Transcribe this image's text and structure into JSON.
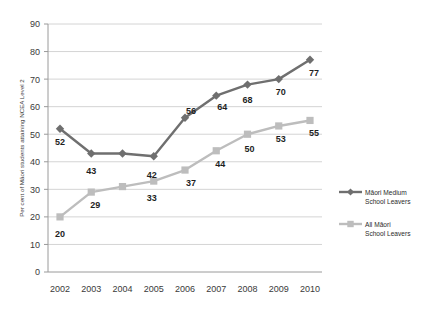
{
  "chart_data": {
    "type": "line",
    "title": "",
    "xlabel": "",
    "ylabel": "Per cent of Māori students attaining NCEA Level 2",
    "categories": [
      "2002",
      "2003",
      "2004",
      "2005",
      "2006",
      "2007",
      "2008",
      "2009",
      "2010"
    ],
    "ylim": [
      0,
      90
    ],
    "ytick_step": 10,
    "yticks": [
      "0",
      "10",
      "20",
      "30",
      "40",
      "50",
      "60",
      "70",
      "80",
      "90"
    ],
    "grid": "horizontal",
    "legend_position": "right",
    "series": [
      {
        "name": "Māori Medium School Leavers",
        "color": "#6f6f6f",
        "marker": "diamond",
        "values": [
          52,
          43,
          43,
          42,
          56,
          64,
          68,
          70,
          77
        ],
        "labels": [
          "52",
          "43",
          "",
          "42",
          "56",
          "64",
          "68",
          "70",
          "77"
        ]
      },
      {
        "name": "All Māori School Leavers",
        "color": "#bdbdbd",
        "marker": "square",
        "values": [
          20,
          29,
          31,
          33,
          37,
          44,
          50,
          53,
          55
        ],
        "labels": [
          "20",
          "29",
          "",
          "33",
          "37",
          "44",
          "50",
          "53",
          "55"
        ]
      }
    ]
  },
  "legend": {
    "entries": [
      {
        "line1": "Māori Medium",
        "line2": "School Leavers",
        "color": "#6f6f6f",
        "marker": "diamond"
      },
      {
        "line1": "All Māori",
        "line2": "School Leavers",
        "color": "#bdbdbd",
        "marker": "square"
      }
    ]
  },
  "axes": {
    "y_title": "Per cent of Māori students attaining NCEA Level 2",
    "y_labels": [
      "90",
      "80",
      "70",
      "60",
      "50",
      "40",
      "30",
      "20",
      "10",
      "0"
    ],
    "x_labels": [
      "2002",
      "2003",
      "2004",
      "2005",
      "2006",
      "2007",
      "2008",
      "2009",
      "2010"
    ]
  },
  "colors": {
    "background": "#ffffff",
    "grid": "#d4d4d4",
    "axis": "#9a9a9a",
    "series_dark": "#6f6f6f",
    "series_light": "#bdbdbd",
    "text": "#2b2b2b"
  }
}
